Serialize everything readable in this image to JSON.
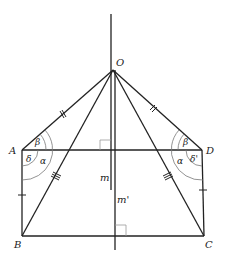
{
  "diagram": {
    "type": "geometry",
    "points": {
      "O": {
        "label": "O",
        "x": 113,
        "y": 70
      },
      "A": {
        "label": "A",
        "x": 22,
        "y": 150
      },
      "D": {
        "label": "D",
        "x": 202,
        "y": 150
      },
      "B": {
        "label": "B",
        "x": 22,
        "y": 236
      },
      "C": {
        "label": "C",
        "x": 204,
        "y": 236
      }
    },
    "lines": {
      "m": {
        "label": "m"
      },
      "m_prime": {
        "label": "m'"
      }
    },
    "angles": {
      "A_beta": "β",
      "A_alpha": "α",
      "A_delta": "δ",
      "D_beta": "β",
      "D_alpha": "α",
      "D_delta": "δ'"
    },
    "colors": {
      "stroke": "#222222",
      "arc": "#777777",
      "rightangle": "#999999"
    }
  }
}
